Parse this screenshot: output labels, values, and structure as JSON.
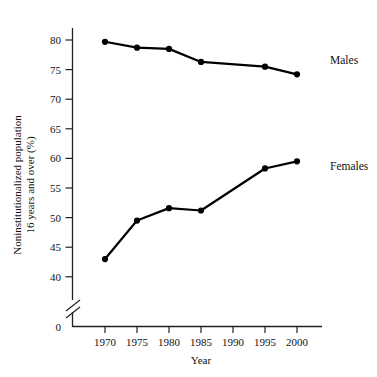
{
  "chart_data": {
    "type": "line",
    "title": "",
    "xlabel": "Year",
    "ylabel": "Noninstitutionalized population 16 years and over (%)",
    "ylabel_line1": "Noninstitutionalized population",
    "ylabel_line2": "16 years and over (%)",
    "x": [
      1970,
      1975,
      1980,
      1985,
      1990,
      1995,
      2000
    ],
    "xtick_labels": [
      "1970",
      "1975",
      "1980",
      "1985",
      "1990",
      "1995",
      "2000"
    ],
    "ytick_labels": [
      "0",
      "40",
      "45",
      "50",
      "55",
      "60",
      "65",
      "70",
      "75",
      "80"
    ],
    "ytick_values": [
      0,
      40,
      45,
      50,
      55,
      60,
      65,
      70,
      75,
      80
    ],
    "ylim": [
      40,
      80
    ],
    "xlim": [
      1970,
      2000
    ],
    "axis_break": true,
    "axis_break_symbol": "double-slash",
    "grid": false,
    "legend_position": "right-inline",
    "series": [
      {
        "name": "Males",
        "label": "Males",
        "color": "#000000",
        "marker": "circle",
        "x": [
          1970,
          1975,
          1980,
          1985,
          1995,
          2000
        ],
        "values": [
          79.7,
          78.7,
          78.5,
          76.3,
          75.5,
          74.2
        ]
      },
      {
        "name": "Females",
        "label": "Females",
        "color": "#000000",
        "marker": "circle",
        "x": [
          1970,
          1975,
          1980,
          1985,
          1995,
          2000
        ],
        "values": [
          43.0,
          49.5,
          51.6,
          51.2,
          58.3,
          59.5
        ]
      }
    ]
  },
  "labels": {
    "males": "Males",
    "females": "Females",
    "year": "Year",
    "y_line1": "Noninstitutionalized population",
    "y_line2": "16 years and over (%)"
  },
  "colors": {
    "line": "#000000",
    "axis": "#222222",
    "background": "#ffffff"
  }
}
